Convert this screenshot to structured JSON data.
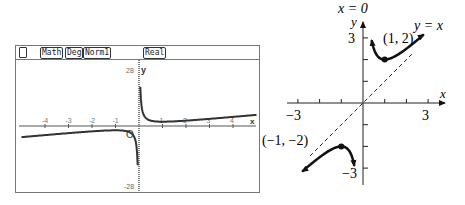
{
  "calculator": {
    "status_bar": {
      "icon": "battery-icon",
      "badges": [
        "Math",
        "Deg",
        "Norm1",
        "Real"
      ]
    },
    "graph": {
      "y_max_label": "28",
      "y_min_label": "-28",
      "y_axis_label": "y",
      "x_axis_label": "x",
      "origin_label": "O",
      "x_tick_labels": [
        "-4",
        "-3",
        "-2",
        "-1",
        "1",
        "2",
        "3",
        "4"
      ]
    }
  },
  "sketch": {
    "asymptote_vertical_label": "x = 0",
    "asymptote_oblique_label": "y = x",
    "y_axis_label": "y",
    "x_axis_label": "x",
    "y_tick_top_label": "3",
    "y_tick_bottom_label": "−3",
    "x_tick_left_label": "−3",
    "x_tick_right_label": "3",
    "point_min_label": "(1, 2)",
    "point_max_label": "(−1, −2)",
    "point_min": [
      1,
      2
    ],
    "point_max": [
      -1,
      -2
    ]
  },
  "chart_data": [
    {
      "type": "line",
      "title": "",
      "function": "y = x + 1/x",
      "xlim": [
        -5,
        5
      ],
      "ylim": [
        -28,
        28
      ],
      "x_ticks": [
        -4,
        -3,
        -2,
        -1,
        1,
        2,
        3,
        4
      ],
      "grid": false
    },
    {
      "type": "line",
      "title": "",
      "function": "y = x + 1/x",
      "xlim": [
        -3,
        3
      ],
      "ylim": [
        -3,
        3
      ],
      "asymptotes": [
        "x = 0",
        "y = x"
      ],
      "extrema": [
        {
          "x": 1,
          "y": 2,
          "kind": "min"
        },
        {
          "x": -1,
          "y": -2,
          "kind": "max"
        }
      ],
      "grid": false
    }
  ]
}
